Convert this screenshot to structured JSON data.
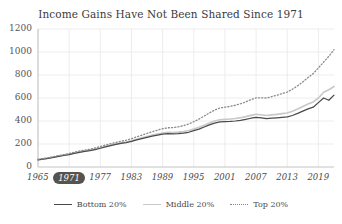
{
  "chart_data": {
    "type": "line",
    "title": "Income Gains Have Not Been Shared Since 1971",
    "xlabel": "",
    "ylabel": "",
    "ylim": [
      0,
      1200
    ],
    "xlim": [
      1965,
      2022
    ],
    "yticks": [
      "0",
      "200",
      "400",
      "600",
      "800",
      "1000",
      "1200"
    ],
    "ytick_values": [
      0,
      200,
      400,
      600,
      800,
      1000,
      1200
    ],
    "xticks": [
      "1965",
      "1971",
      "1977",
      "1983",
      "1989",
      "1995",
      "2001",
      "2007",
      "2013",
      "2019"
    ],
    "xtick_values": [
      1965,
      1971,
      1977,
      1983,
      1989,
      1995,
      2001,
      2007,
      2013,
      2019
    ],
    "highlighted_xtick": "1971",
    "grid": true,
    "legend_position": "bottom",
    "x": [
      1965,
      1966,
      1967,
      1968,
      1969,
      1970,
      1971,
      1972,
      1973,
      1974,
      1975,
      1976,
      1977,
      1978,
      1979,
      1980,
      1981,
      1982,
      1983,
      1984,
      1985,
      1986,
      1987,
      1988,
      1989,
      1990,
      1991,
      1992,
      1993,
      1994,
      1995,
      1996,
      1997,
      1998,
      1999,
      2000,
      2001,
      2002,
      2003,
      2004,
      2005,
      2006,
      2007,
      2008,
      2009,
      2010,
      2011,
      2012,
      2013,
      2014,
      2015,
      2016,
      2017,
      2018,
      2019,
      2020,
      2021,
      2022
    ],
    "series": [
      {
        "name": "Bottom 20%",
        "color": "#4a4a4a",
        "style": "solid",
        "values": [
          62,
          68,
          75,
          84,
          93,
          100,
          108,
          118,
          128,
          135,
          142,
          152,
          163,
          175,
          186,
          196,
          205,
          212,
          222,
          235,
          246,
          258,
          268,
          277,
          286,
          290,
          288,
          290,
          294,
          302,
          316,
          330,
          348,
          366,
          382,
          392,
          394,
          396,
          400,
          406,
          414,
          424,
          432,
          428,
          420,
          424,
          428,
          432,
          436,
          448,
          466,
          486,
          506,
          520,
          560,
          600,
          580,
          625
        ]
      },
      {
        "name": "Middle 20%",
        "color": "#c8c8c8",
        "style": "solid",
        "values": [
          64,
          71,
          78,
          87,
          96,
          104,
          112,
          122,
          132,
          140,
          147,
          157,
          168,
          180,
          191,
          201,
          210,
          218,
          229,
          242,
          254,
          266,
          277,
          287,
          296,
          301,
          300,
          303,
          308,
          317,
          331,
          346,
          364,
          383,
          400,
          411,
          414,
          417,
          422,
          429,
          438,
          449,
          458,
          455,
          448,
          453,
          458,
          464,
          470,
          484,
          504,
          526,
          548,
          566,
          600,
          650,
          672,
          700
        ]
      },
      {
        "name": "Top 20%",
        "color": "#8a8a8a",
        "style": "dotted",
        "values": [
          66,
          73,
          81,
          90,
          100,
          108,
          117,
          128,
          139,
          147,
          155,
          166,
          178,
          191,
          203,
          214,
          224,
          233,
          246,
          262,
          277,
          292,
          307,
          320,
          333,
          341,
          342,
          349,
          359,
          374,
          394,
          417,
          443,
          470,
          495,
          513,
          520,
          527,
          537,
          550,
          566,
          585,
          601,
          602,
          600,
          612,
          624,
          638,
          652,
          676,
          706,
          740,
          778,
          812,
          862,
          912,
          962,
          1020
        ]
      }
    ]
  },
  "legend": {
    "items": [
      {
        "label": "Bottom 20%",
        "color": "#4a4a4a",
        "style": "solid"
      },
      {
        "label": "Middle 20%",
        "color": "#c8c8c8",
        "style": "solid"
      },
      {
        "label": "Top 20%",
        "color": "#8a8a8a",
        "style": "dotted"
      }
    ]
  },
  "colors": {
    "background": "#ffffff",
    "grid": "#e8e8e8",
    "axis": "#bdbdbd",
    "text": "#4a4a4a",
    "highlight_pill": "#55544f",
    "highlight_text": "#ffffff"
  }
}
